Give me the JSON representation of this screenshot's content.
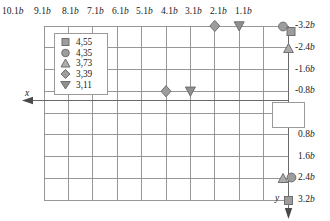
{
  "chart_data": {
    "type": "scatter",
    "title": "",
    "xlabel": "x",
    "ylabel": "y",
    "grid": true,
    "legend_position": "upper-left-inside",
    "x_axis": {
      "label": "x",
      "direction": "left",
      "position": "top",
      "tick_labels": [
        "10.1b",
        "9.1b",
        "8.1b",
        "7.1b",
        "6.1b",
        "5.1b",
        "4.1b",
        "3.1b",
        "2.1b",
        "1.1b"
      ],
      "tick_values": [
        10.1,
        9.1,
        8.1,
        7.1,
        6.1,
        5.1,
        4.1,
        3.1,
        2.1,
        1.1
      ],
      "unit": "b"
    },
    "y_axis": {
      "label": "y",
      "direction": "down",
      "position": "right",
      "tick_labels": [
        "-3.2b",
        "-2.4b",
        "-1.6b",
        "-0.8b",
        "0.8b",
        "1.6b",
        "2.4b",
        "3.2b"
      ],
      "tick_values": [
        -3.2,
        -2.4,
        -1.6,
        -0.8,
        0.8,
        1.6,
        2.4,
        3.2
      ],
      "unit": "b"
    },
    "legend": {
      "entries": [
        {
          "marker": "square",
          "label": "4,55"
        },
        {
          "marker": "circle",
          "label": "4,35"
        },
        {
          "marker": "triangle-up",
          "label": "3,73"
        },
        {
          "marker": "diamond",
          "label": "3,39"
        },
        {
          "marker": "triangle-down",
          "label": "3,11"
        }
      ]
    },
    "series": [
      {
        "name": "4,55",
        "marker": "square",
        "points": [
          {
            "x": 0.75,
            "y": -3.2
          },
          {
            "x": 0.55,
            "y": 3.2
          }
        ]
      },
      {
        "name": "4,35",
        "marker": "circle",
        "points": [
          {
            "x": 1.0,
            "y": -3.2
          },
          {
            "x": 0.75,
            "y": 2.4
          }
        ]
      },
      {
        "name": "3,73",
        "marker": "triangle-up",
        "points": [
          {
            "x": 0.8,
            "y": -2.4
          },
          {
            "x": 1.0,
            "y": 2.4
          }
        ]
      },
      {
        "name": "3,39",
        "marker": "diamond",
        "points": [
          {
            "x": 3.1,
            "y": -3.2
          },
          {
            "x": 5.1,
            "y": -0.8
          }
        ]
      },
      {
        "name": "3,11",
        "marker": "triangle-down",
        "points": [
          {
            "x": 2.1,
            "y": -3.2
          },
          {
            "x": 4.1,
            "y": -0.8
          }
        ]
      }
    ],
    "colors": {
      "marker_fill": "#9d9d9d",
      "marker_stroke": "#6f6f6f",
      "grid": "#8c8c8c",
      "axis": "#6a6a6a",
      "text": "#1a1a1a",
      "panel": "#ffffff"
    }
  }
}
